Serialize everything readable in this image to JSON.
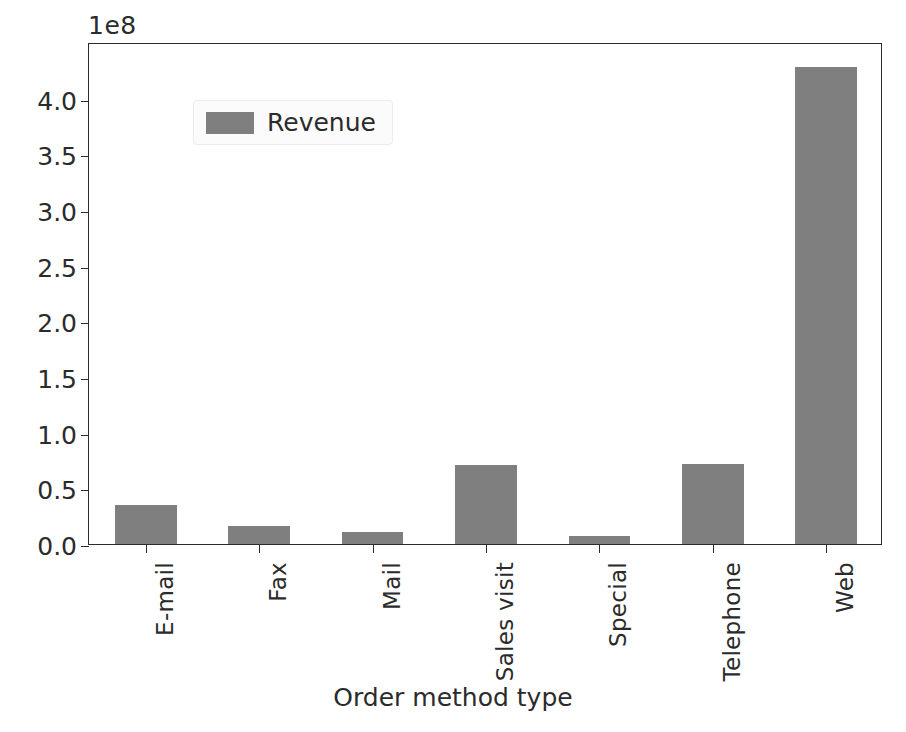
{
  "chart_data": {
    "type": "bar",
    "title": "",
    "subtitle": "",
    "xlabel": "Order method type",
    "ylabel": "",
    "offset_text": "1e8",
    "categories": [
      "E-mail",
      "Fax",
      "Mail",
      "Sales visit",
      "Special",
      "Telephone",
      "Web"
    ],
    "series": [
      {
        "name": "Revenue",
        "color": "#7f7f7f",
        "values": [
          35000000,
          16000000,
          11000000,
          71000000,
          7000000,
          72000000,
          429000000
        ]
      }
    ],
    "values_scaled_1e8": [
      0.35,
      0.16,
      0.11,
      0.71,
      0.07,
      0.72,
      4.29
    ],
    "ylim": [
      0,
      451000000.0
    ],
    "ytick_values": [
      0,
      50000000,
      100000000,
      150000000,
      200000000,
      250000000,
      300000000,
      350000000,
      400000000
    ],
    "ytick_labels": [
      "0.0",
      "0.5",
      "1.0",
      "1.5",
      "2.0",
      "2.5",
      "3.0",
      "3.5",
      "4.0"
    ],
    "grid": false,
    "legend": {
      "entries": [
        "Revenue"
      ],
      "position": "upper left"
    },
    "axis_color": "#2b2b2b",
    "background": "#ffffff"
  }
}
